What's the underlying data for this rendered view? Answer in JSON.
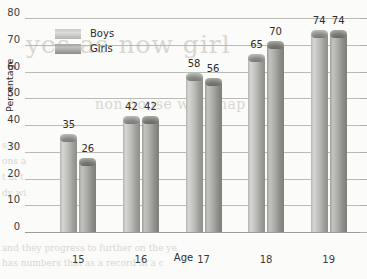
{
  "chart_data": {
    "type": "bar",
    "title": "",
    "xlabel": "Age",
    "ylabel": "Percentage",
    "categories": [
      "15",
      "16",
      "17",
      "18",
      "19"
    ],
    "series": [
      {
        "name": "Boys",
        "values": [
          35,
          42,
          58,
          65,
          74
        ]
      },
      {
        "name": "Girls",
        "values": [
          26,
          42,
          56,
          70,
          74
        ]
      }
    ],
    "ylim": [
      0,
      80
    ],
    "yticks": [
      0,
      10,
      20,
      30,
      40,
      50,
      60,
      70,
      80
    ],
    "grid": "horizontal",
    "legend_position": "top-left",
    "data_labels": true
  },
  "legend": {
    "items": [
      {
        "label": "Boys",
        "swatch": "boys-swatch",
        "color": "#c9c9c6"
      },
      {
        "label": "Girls",
        "swatch": "girls-swatch",
        "color": "#a4a4a1"
      }
    ]
  },
  "axes": {
    "y_title": "Percentage",
    "x_title": "Age",
    "y_tick_labels": [
      "0",
      "10",
      "20",
      "30",
      "40",
      "50",
      "60",
      "70",
      "80"
    ],
    "x_tick_labels": [
      "15",
      "16",
      "17",
      "18",
      "19"
    ]
  },
  "bleed_text": {
    "line1": "yes as now girl",
    "line2": "non house will chap",
    "line3": "s co",
    "line4": "ons a",
    "line5": "t in t",
    "line6": "dy wi",
    "line7": "and they progress to further on the ye",
    "line8": "has numbers that as a record in a c"
  },
  "colors": {
    "background": "#fbfbf9",
    "gridline": "#b9b9b6",
    "axis": "#9a9a97",
    "text": "#2d2d2d",
    "boys_bar": "#bcbcb9",
    "girls_bar": "#a9a9a6"
  }
}
